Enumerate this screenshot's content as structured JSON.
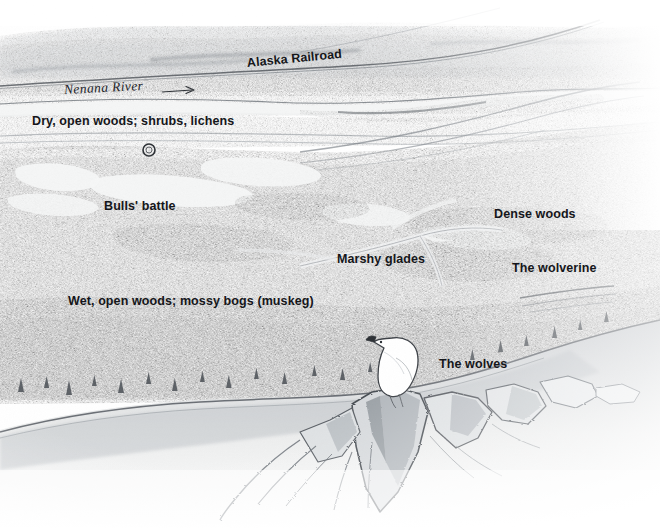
{
  "illustration": {
    "medium": "pencil drawing",
    "subject": "aerial view of Alaskan taiga valley with white ptarmigan on rocky ridge",
    "palette": {
      "paper": "#ffffff",
      "haze": "#e9eaec",
      "forest_light": "#c9ccd0",
      "forest_mid": "#9aa0a6",
      "forest_dark": "#6e747b",
      "ink": "#15161a",
      "rock_shadow": "#55595f",
      "clearing": "#f4f5f6"
    }
  },
  "labels": [
    {
      "id": "alaska-railroad",
      "text": "Alaska Railroad",
      "x": 247,
      "y": 57,
      "style": "sans"
    },
    {
      "id": "nenana-river",
      "text": "Nenana River",
      "x": 64,
      "y": 84,
      "style": "serif-italic"
    },
    {
      "id": "dry-open-woods",
      "text": "Dry, open woods; shrubs, lichens",
      "x": 32,
      "y": 115,
      "style": "sans"
    },
    {
      "id": "bulls-battle",
      "text": "Bulls' battle",
      "x": 104,
      "y": 200,
      "style": "sans"
    },
    {
      "id": "dense-woods",
      "text": "Dense woods",
      "x": 494,
      "y": 208,
      "style": "sans"
    },
    {
      "id": "marshy-glades",
      "text": "Marshy glades",
      "x": 337,
      "y": 253,
      "style": "sans"
    },
    {
      "id": "the-wolverine",
      "text": "The wolverine",
      "x": 512,
      "y": 262,
      "style": "sans"
    },
    {
      "id": "wet-open-woods",
      "text": "Wet, open woods; mossy bogs (muskeg)",
      "x": 68,
      "y": 295,
      "style": "sans"
    },
    {
      "id": "the-wolves",
      "text": "The wolves",
      "x": 439,
      "y": 358,
      "style": "sans"
    }
  ],
  "markers": {
    "battle_circle": {
      "cx": 149,
      "cy": 150,
      "r": 6,
      "note": "small ringed marker above Bulls' battle label"
    },
    "river_arrow": {
      "x1": 162,
      "y1": 92,
      "x2": 196,
      "y2": 90,
      "note": "flow direction arrow after Nenana River"
    }
  },
  "figures": {
    "ptarmigan": {
      "x": 372,
      "y": 334,
      "w": 50,
      "h": 62,
      "color": "#ffffff",
      "outline": "#3c4046",
      "note": "white ptarmigan perched on rock outcrop"
    }
  }
}
